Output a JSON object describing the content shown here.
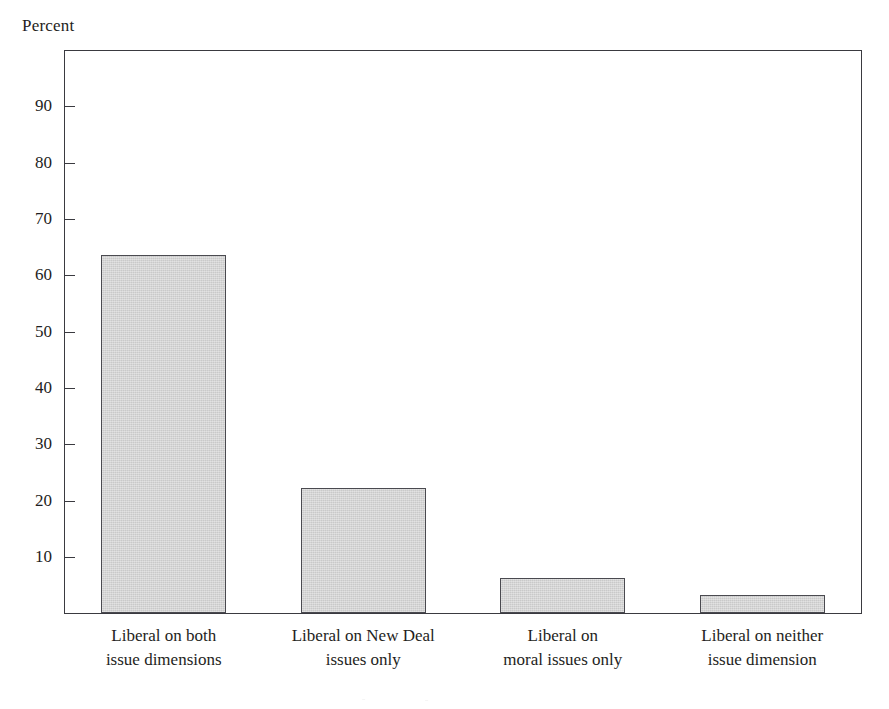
{
  "chart_data": {
    "type": "bar",
    "title": "",
    "subtitle": "",
    "xlabel": "",
    "ylabel": "Percent",
    "ylim": [
      0,
      100
    ],
    "ytick_values": [
      90,
      80,
      70,
      60,
      50,
      40,
      30,
      20,
      10
    ],
    "ytick_labels": [
      "90",
      "80",
      "70",
      "60",
      "50",
      "40",
      "30",
      "20",
      "10"
    ],
    "grid": false,
    "legend": "none",
    "bar_color": "#c9c9c9",
    "bar_edge_color": "#4a4a50",
    "axis_color": "#3a3a40",
    "categories": [
      "Liberal on both issue dimensions",
      "Liberal on New Deal issues only",
      "Liberal on moral issues only",
      "Liberal on neither issue dimension"
    ],
    "category_label_lines": [
      [
        "Liberal on both",
        "issue dimensions"
      ],
      [
        "Liberal on New Deal",
        "issues only"
      ],
      [
        "Liberal on",
        "moral issues only"
      ],
      [
        "Liberal on neither",
        "issue dimension"
      ]
    ],
    "values": [
      63.7,
      22.3,
      6.3,
      3.3
    ]
  }
}
